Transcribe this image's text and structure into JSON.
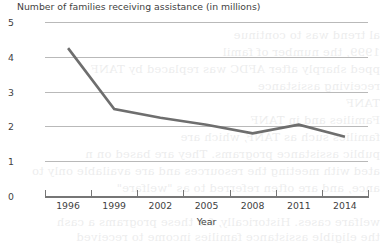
{
  "chart_data": {
    "type": "line",
    "title": "Number of families receiving assistance (in millions)",
    "xlabel": "Year",
    "ylabel": "",
    "categories": [
      "1996",
      "1999",
      "2002",
      "2005",
      "2008",
      "2011",
      "2014"
    ],
    "x": [
      1996,
      1999,
      2002,
      2005,
      2008,
      2011,
      2014
    ],
    "values": [
      4.25,
      2.5,
      2.25,
      2.05,
      1.8,
      2.05,
      1.7
    ],
    "series": [
      {
        "name": "Number of families receiving assistance (in millions)",
        "values": [
          4.25,
          2.5,
          2.25,
          2.05,
          1.8,
          2.05,
          1.7
        ]
      }
    ],
    "ylim": [
      0,
      5
    ],
    "yticks": [
      0,
      1,
      2,
      3,
      4,
      5
    ],
    "ytick_labels": [
      "0",
      "1",
      "2",
      "3",
      "4",
      "5"
    ],
    "xlim": [
      1994.5,
      2015.5
    ],
    "grid": "horizontal",
    "legend": "none",
    "line_color": "#6e6e6e",
    "gridline_color": "#b9b9b9",
    "axis_color": "#767676",
    "text_color": "#3f3f3f",
    "background_color": "#ffffff"
  },
  "figure": {
    "title": "Number of families receiving assistance (in millions)",
    "xaxis_title": "Year",
    "ytick_labels": [
      "5",
      "4",
      "3",
      "2",
      "1",
      "0"
    ],
    "xtick_labels": [
      "1996",
      "1999",
      "2002",
      "2005",
      "2008",
      "2011",
      "2014"
    ]
  },
  "page_bleedthrough": {
    "lines": [
      "al trend was to continue",
      "1999, the number of famil",
      "pped sharply after AFDC was replaced by TANF",
      "receiving assistance",
      "TANF",
      "Families and in TANF",
      "families such as TANF, which are",
      "public assistance programs. They are based on n",
      "ated with meeting the resources and are available only to",
      "ance, and are often referred to as \"welfare\"",
      "welfare cases. Historically, for these programs a cash",
      "the eligible assistance families income to received"
    ]
  }
}
